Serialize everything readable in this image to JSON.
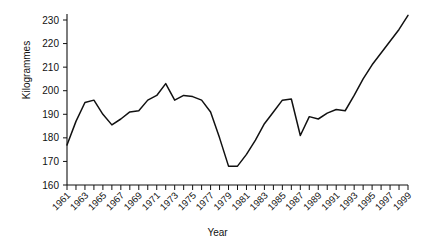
{
  "chart_data": {
    "type": "line",
    "title": "",
    "xlabel": "Year",
    "ylabel": "Kilogrammes",
    "xlim": [
      1961,
      1999
    ],
    "ylim": [
      160,
      235
    ],
    "yticks": [
      160,
      170,
      180,
      190,
      200,
      210,
      220,
      230
    ],
    "ytick_labels": [
      "160",
      "170",
      "180",
      "190",
      "200",
      "210",
      "220",
      "230"
    ],
    "grid": false,
    "legend": "none",
    "x": [
      1961,
      1962,
      1963,
      1964,
      1965,
      1966,
      1967,
      1968,
      1969,
      1970,
      1971,
      1972,
      1973,
      1974,
      1975,
      1976,
      1977,
      1978,
      1979,
      1980,
      1981,
      1982,
      1983,
      1984,
      1985,
      1986,
      1987,
      1988,
      1989,
      1990,
      1991,
      1992,
      1993,
      1994,
      1995,
      1996,
      1997,
      1998,
      1999
    ],
    "xtick_labels": [
      "1961",
      "1962",
      "1963",
      "1964",
      "1965",
      "1966",
      "1967",
      "1968",
      "1969",
      "1970",
      "1971",
      "1972",
      "1973",
      "1974",
      "1975",
      "1976",
      "1977",
      "1978",
      "1979",
      "1980",
      "1981",
      "1982",
      "1983",
      "1984",
      "1985",
      "1986",
      "1987",
      "1988",
      "1989",
      "1990",
      "1991",
      "1992",
      "1993",
      "1994",
      "1995",
      "1996",
      "1997",
      "1998",
      "1999"
    ],
    "xtick_labels_shown": [
      "1961",
      "1963",
      "1965",
      "1967",
      "1969",
      "1971",
      "1973",
      "1975",
      "1977",
      "1979",
      "1981",
      "1983",
      "1985",
      "1987",
      "1989",
      "1991",
      "1993",
      "1995",
      "1997",
      "1999"
    ],
    "values": [
      177,
      187,
      195,
      196,
      190,
      185.5,
      188,
      191,
      191.5,
      196,
      198,
      203,
      196,
      198,
      197.5,
      196,
      191,
      180,
      168,
      168,
      173,
      179,
      186,
      191,
      196,
      196.5,
      181,
      189,
      188,
      190.5,
      192,
      191.5,
      198,
      205,
      211,
      216,
      221,
      226,
      232
    ],
    "series": [
      {
        "name": "Kilogrammes",
        "color": "#111111",
        "values": [
          177,
          187,
          195,
          196,
          190,
          185.5,
          188,
          191,
          191.5,
          196,
          198,
          203,
          196,
          198,
          197.5,
          196,
          191,
          180,
          168,
          168,
          173,
          179,
          186,
          191,
          196,
          196.5,
          181,
          189,
          188,
          190.5,
          192,
          191.5,
          198,
          205,
          211,
          216,
          221,
          226,
          232
        ]
      }
    ]
  }
}
